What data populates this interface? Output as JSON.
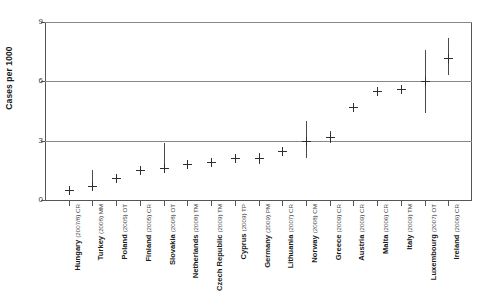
{
  "chart_data": {
    "type": "scatter",
    "title": "",
    "xlabel": "",
    "ylabel": "Cases per 1000",
    "ylim": [
      0,
      9
    ],
    "yticks": [
      0,
      3,
      6,
      9
    ],
    "ytick_labels": [
      "0",
      "3",
      "6",
      "9"
    ],
    "grid": "horizontal",
    "legend": "none",
    "error_bars": "vertical confidence intervals",
    "categories": [
      "Hungary",
      "Turkey",
      "Poland",
      "Finland",
      "Slovakia",
      "Netherlands",
      "Czech Republic",
      "Cyprus",
      "Germany",
      "Lithuania",
      "Norway",
      "Greece",
      "Austria",
      "Malta",
      "Italy",
      "Luxembourg",
      "Ireland"
    ],
    "category_notes": [
      "(2007/8) CR",
      "(2008) MM",
      "(2005) OT",
      "(2005) CR",
      "(2008) OT",
      "(2008) TM",
      "(2009) TM",
      "(2009) TP",
      "(2009) PM",
      "(2007) CR",
      "(2008) CM",
      "(2009) CR",
      "(2009) CR",
      "(2006) CR",
      "(2009) TM",
      "(2007) OT",
      "(2006) CR"
    ],
    "values": [
      0.5,
      0.7,
      1.1,
      1.5,
      1.6,
      1.8,
      1.9,
      2.1,
      2.1,
      2.5,
      3.0,
      3.2,
      4.7,
      5.5,
      5.6,
      6.0,
      7.2
    ],
    "lower": [
      0.35,
      0.6,
      1.0,
      1.35,
      1.5,
      1.8,
      1.9,
      1.85,
      1.8,
      2.45,
      2.1,
      2.9,
      4.6,
      5.3,
      5.4,
      4.4,
      6.3
    ],
    "upper": [
      0.65,
      1.5,
      1.25,
      1.65,
      2.9,
      1.8,
      1.9,
      2.35,
      2.4,
      2.55,
      4.0,
      3.5,
      4.8,
      5.7,
      5.8,
      7.6,
      8.2
    ]
  }
}
